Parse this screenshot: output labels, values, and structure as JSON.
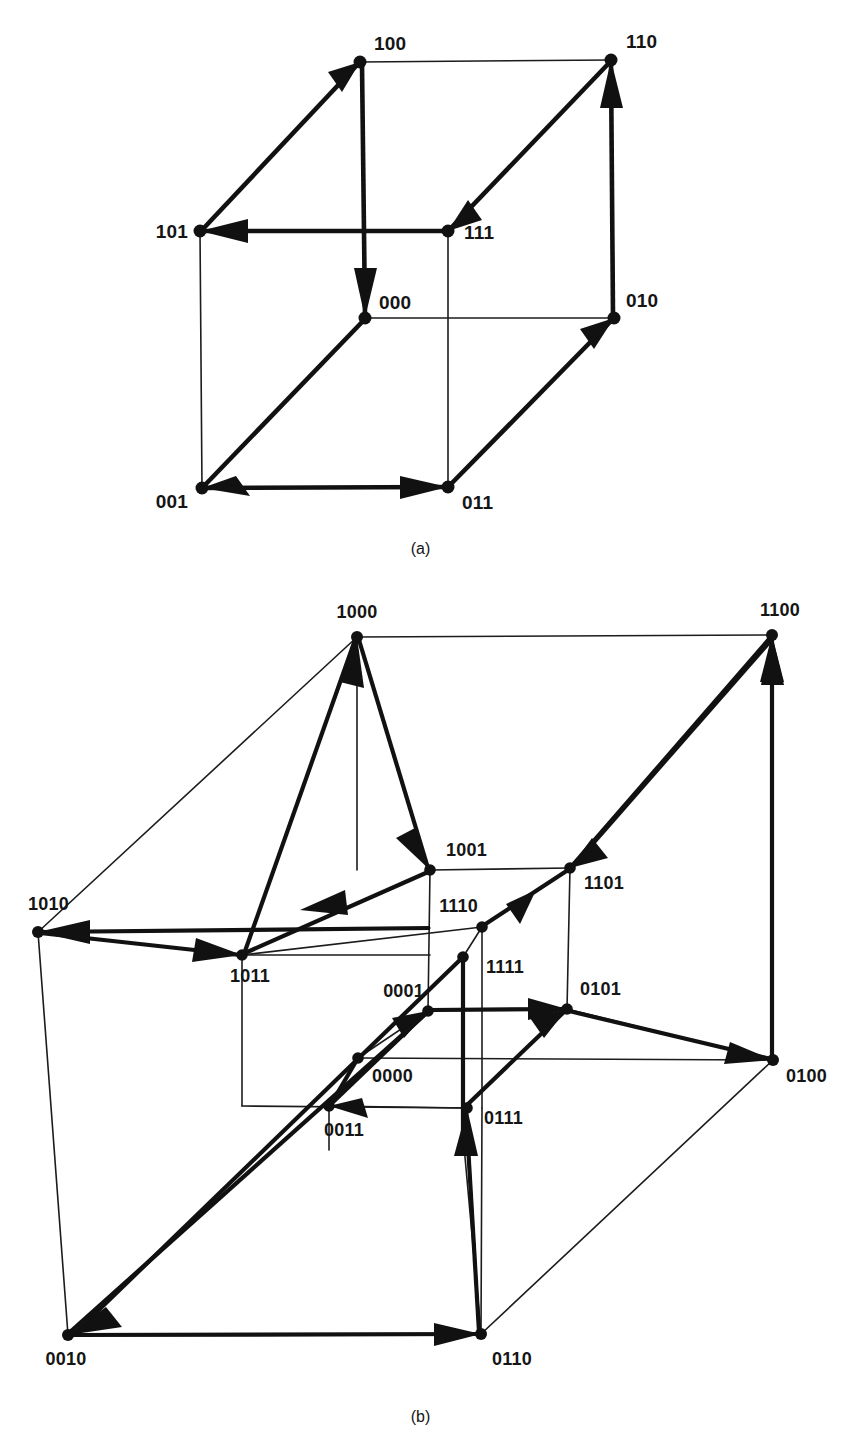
{
  "figure": {
    "captions": {
      "a": "(a)",
      "b": "(b)"
    }
  },
  "diagram_a": {
    "name": "3-dimensional binary hypercube",
    "dimension": 3,
    "node_labels": [
      "100",
      "110",
      "101",
      "111",
      "000",
      "010",
      "001",
      "011"
    ],
    "nodes": [
      {
        "id": "100",
        "label": "100",
        "x": 360,
        "y": 62,
        "label_x": 374,
        "label_y": 50,
        "anchor": "start"
      },
      {
        "id": "110",
        "label": "110",
        "x": 611,
        "y": 60,
        "label_x": 626,
        "label_y": 48,
        "anchor": "start"
      },
      {
        "id": "101",
        "label": "101",
        "x": 200,
        "y": 231,
        "label_x": 190,
        "label_y": 237,
        "anchor": "end"
      },
      {
        "id": "111",
        "label": "111",
        "x": 448,
        "y": 231,
        "label_x": 463,
        "label_y": 238,
        "anchor": "start"
      },
      {
        "id": "000",
        "label": "000",
        "x": 365,
        "y": 318,
        "label_x": 379,
        "label_y": 309,
        "anchor": "start"
      },
      {
        "id": "010",
        "label": "010",
        "x": 614,
        "y": 318,
        "label_x": 626,
        "label_y": 307,
        "anchor": "start"
      },
      {
        "id": "001",
        "label": "001",
        "x": 202,
        "y": 488,
        "label_x": 190,
        "label_y": 508,
        "anchor": "end"
      },
      {
        "id": "011",
        "label": "011",
        "x": 448,
        "y": 487,
        "label_x": 461,
        "label_y": 508,
        "anchor": "start"
      }
    ],
    "thin_edges": [
      [
        "100",
        "110"
      ],
      [
        "101",
        "001"
      ],
      [
        "111",
        "011"
      ],
      [
        "110",
        "010"
      ],
      [
        "000",
        "010"
      ],
      [
        "101",
        "111"
      ],
      [
        "100",
        "000"
      ],
      [
        "001",
        "011"
      ]
    ],
    "directed_edges": [
      {
        "from": "101",
        "to": "100",
        "desc": "101 to 100"
      },
      {
        "from": "111",
        "to": "101",
        "desc": "111 to 101"
      },
      {
        "from": "110",
        "to": "111",
        "desc": "110 to 111"
      },
      {
        "from": "010",
        "to": "110",
        "desc": "010 to 110"
      },
      {
        "from": "100",
        "to": "000",
        "desc": "100 to 000"
      },
      {
        "from": "000",
        "to": "001",
        "desc": "000 to 001"
      },
      {
        "from": "001",
        "to": "011",
        "desc": "001 to 011"
      },
      {
        "from": "011",
        "to": "010",
        "desc": "011 to 010"
      }
    ]
  },
  "diagram_b": {
    "name": "4-dimensional binary hypercube",
    "dimension": 4,
    "node_labels": [
      "1000",
      "1100",
      "1001",
      "1101",
      "1010",
      "1011",
      "1110",
      "1111",
      "0001",
      "0101",
      "0000",
      "0100",
      "0011",
      "0111",
      "0010",
      "0110"
    ],
    "nodes": [
      {
        "id": "1000",
        "label": "1000",
        "x": 357,
        "y": 47,
        "label_x": 344,
        "label_y": 28,
        "anchor": "middle"
      },
      {
        "id": "1100",
        "label": "1100",
        "x": 772,
        "y": 45,
        "label_x": 760,
        "label_y": 26,
        "anchor": "start"
      },
      {
        "id": "1001",
        "label": "1001",
        "x": 430,
        "y": 280,
        "label_x": 446,
        "label_y": 268,
        "anchor": "start"
      },
      {
        "id": "1101",
        "label": "1101",
        "x": 570,
        "y": 278,
        "label_x": 584,
        "label_y": 295,
        "anchor": "start"
      },
      {
        "id": "1010",
        "label": "1010",
        "x": 38,
        "y": 342,
        "label_x": 28,
        "label_y": 320,
        "anchor": "end"
      },
      {
        "id": "1011",
        "label": "1011",
        "x": 242,
        "y": 365,
        "label_x": 252,
        "label_y": 392,
        "anchor": "end"
      },
      {
        "id": "1110",
        "label": "1110",
        "x": 482,
        "y": 337,
        "label_x": 466,
        "label_y": 322,
        "anchor": "end"
      },
      {
        "id": "1111",
        "label": "1111",
        "x": 463,
        "y": 367,
        "label_x": 484,
        "label_y": 383,
        "anchor": "start"
      },
      {
        "id": "0001",
        "label": "0001",
        "x": 428,
        "y": 421,
        "label_x": 416,
        "label_y": 407,
        "anchor": "end"
      },
      {
        "id": "0101",
        "label": "0101",
        "x": 567,
        "y": 419,
        "label_x": 580,
        "label_y": 405,
        "anchor": "start"
      },
      {
        "id": "0000",
        "label": "0000",
        "x": 358,
        "y": 468,
        "label_x": 372,
        "label_y": 490,
        "anchor": "start"
      },
      {
        "id": "0100",
        "label": "0100",
        "x": 773,
        "y": 470,
        "label_x": 786,
        "label_y": 490,
        "anchor": "start"
      },
      {
        "id": "0011",
        "label": "0011",
        "x": 329,
        "y": 516,
        "label_x": 340,
        "label_y": 544,
        "anchor": "end"
      },
      {
        "id": "0111",
        "label": "0111",
        "x": 467,
        "y": 518,
        "label_x": 482,
        "label_y": 534,
        "anchor": "start"
      },
      {
        "id": "0010",
        "label": "0010",
        "x": 68,
        "y": 745,
        "label_x": 58,
        "label_y": 772,
        "anchor": "end"
      },
      {
        "id": "0110",
        "label": "0110",
        "x": 481,
        "y": 744,
        "label_x": 492,
        "label_y": 772,
        "anchor": "start"
      }
    ],
    "thin_edges": [
      [
        "1000",
        "1100"
      ],
      [
        "1000",
        "1010"
      ],
      [
        "1010",
        "0010"
      ],
      [
        "1100",
        "0100"
      ],
      [
        "0010",
        "0110"
      ],
      [
        "0110",
        "0100"
      ],
      [
        "1001",
        "1101"
      ],
      [
        "1001",
        "0001"
      ],
      [
        "1101",
        "0101"
      ],
      [
        "0001",
        "0101"
      ],
      [
        "1010",
        "1011"
      ],
      [
        "1011",
        "0011"
      ],
      [
        "0011",
        "0111"
      ],
      [
        "0111",
        "1111"
      ],
      [
        "1110",
        "1111"
      ],
      [
        "1011",
        "1110"
      ],
      [
        "0000",
        "0001"
      ],
      [
        "0000",
        "0100"
      ],
      [
        "0000",
        "0011"
      ],
      [
        "1000",
        "1001"
      ],
      [
        "1110",
        "0110"
      ],
      [
        "0101",
        "0100"
      ]
    ],
    "directed_edges": [
      {
        "from": "1010",
        "to": "1000",
        "desc": "1010 to 1000"
      },
      {
        "from": "1000",
        "to": "1001",
        "desc": "1000 to 1001"
      },
      {
        "from": "1001",
        "to": "1011",
        "desc": "1001 to 1011"
      },
      {
        "from": "1011",
        "to": "1010",
        "desc": "1011 to 1010"
      },
      {
        "from": "1101",
        "to": "1100",
        "desc": "1101 to 1100"
      },
      {
        "from": "1100",
        "to": "1101",
        "desc": "1100 to 1101"
      },
      {
        "from": "1110",
        "to": "1101",
        "desc": "1110 to 1101"
      },
      {
        "from": "1111",
        "to": "1110",
        "desc": "1111 to 1110"
      },
      {
        "from": "0011",
        "to": "0001",
        "desc": "0011 to 0001"
      },
      {
        "from": "0001",
        "to": "0101",
        "desc": "0001 to 0101"
      },
      {
        "from": "0101",
        "to": "0100",
        "desc": "0101 to 0100"
      },
      {
        "from": "0111",
        "to": "0101",
        "desc": "0111 to 0101"
      },
      {
        "from": "0010",
        "to": "0110",
        "desc": "0010 to 0110"
      },
      {
        "from": "0110",
        "to": "0111",
        "desc": "0110 to 0111"
      },
      {
        "from": "0000",
        "to": "0011",
        "desc": "0000 to 0011"
      },
      {
        "from": "1111",
        "to": "0010",
        "desc": "1111 long diagonal to 0010"
      }
    ]
  }
}
